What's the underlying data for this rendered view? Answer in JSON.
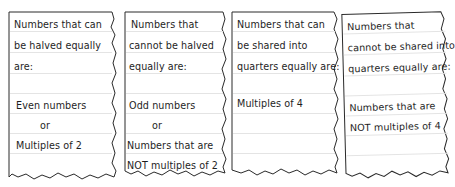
{
  "cards": [
    {
      "id": "halved",
      "lines": [
        "Numbers that can",
        "be halved equally",
        "are:",
        "",
        "Even numbers",
        "or",
        "Multiples of 2"
      ]
    },
    {
      "id": "not-halved",
      "lines": [
        "Numbers that",
        "cannot be halved",
        "equally are:",
        "",
        "Odd numbers",
        "or",
        "Numbers that are",
        "NOT multiples of 2"
      ]
    },
    {
      "id": "quarters",
      "lines": [
        "Numbers that can",
        "be shared into",
        "quarters equally are:",
        "",
        "Multiples of 4"
      ]
    },
    {
      "id": "not-quarters",
      "lines": [
        "Numbers that",
        "cannot be shared into",
        "quarters equally are:",
        "",
        "Numbers that are",
        "NOT multiples of 4"
      ]
    }
  ],
  "colors": {
    "border": "#2a2a2a",
    "rule": "#e4e4e4",
    "text": "#1e1e1e"
  }
}
